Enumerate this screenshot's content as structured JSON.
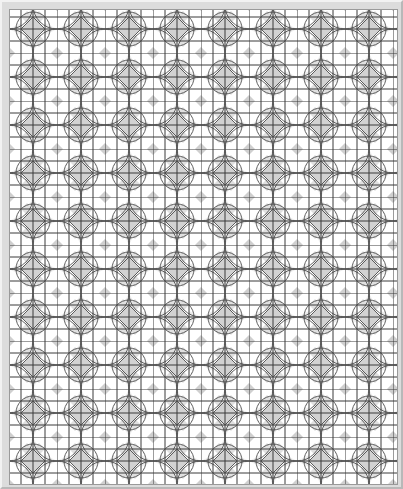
{
  "image": {
    "title": "Geometric tile pattern",
    "description": "Repeating grid of squares overlaid with interlocking circles forming star and diamond motifs",
    "colors": {
      "frame": "#dcdcdc",
      "line": "#3a3a3a",
      "fill_light": "#ededed",
      "fill_mid": "#cfcfcf",
      "background": "#ffffff"
    },
    "grid_spacing_px": 12,
    "motif_period_px": 48
  }
}
